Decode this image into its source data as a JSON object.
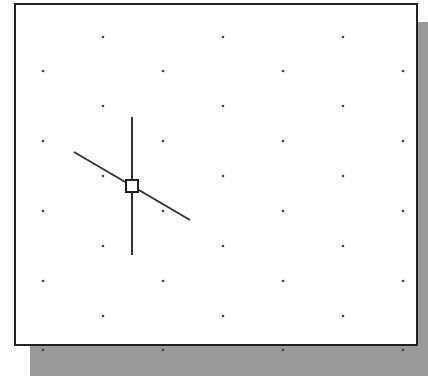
{
  "drawing": {
    "type": "cad-viewport-grid-snap",
    "colors": {
      "frame": "#222222",
      "shadow": "#9a9a9a",
      "dot": "#444444",
      "cursor": "#333333",
      "background": "#ffffff"
    },
    "grid": {
      "columns_x": [
        43,
        103,
        163,
        223,
        283,
        343,
        403
      ],
      "rows_y": [
        37,
        71,
        106,
        141,
        176,
        211,
        246,
        281,
        316,
        350
      ],
      "pattern": "staggered"
    },
    "cursor": {
      "crosshair_center": [
        132,
        186
      ],
      "vertical_line": {
        "x": 132,
        "y1": 117,
        "y2": 255
      },
      "rubber_band_line": {
        "x1": 74,
        "y1": 152,
        "x2": 190,
        "y2": 220
      },
      "pickbox_size": 12
    }
  }
}
